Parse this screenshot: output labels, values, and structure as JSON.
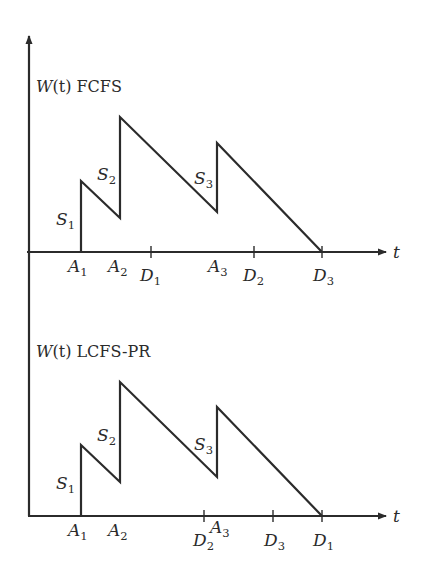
{
  "diagram": {
    "y_axis_x": 29,
    "axis_color": "#2b2b2b",
    "panels": [
      {
        "id": "fcfs",
        "title_fn": "W(t)",
        "title_fn_w": "W",
        "title_fn_arg": "(t)",
        "title_policy": "FCFS",
        "baseline_y": 252,
        "x_axis_label": "t",
        "arrivals": [
          {
            "name": "A",
            "sub": "1",
            "x": 81
          },
          {
            "name": "A",
            "sub": "2",
            "x": 120
          },
          {
            "name": "A",
            "sub": "3",
            "x": 217
          }
        ],
        "departures": [
          {
            "name": "D",
            "sub": "1",
            "x": 151
          },
          {
            "name": "D",
            "sub": "2",
            "x": 254
          },
          {
            "name": "D",
            "sub": "3",
            "x": 322
          }
        ],
        "service_labels": [
          {
            "name": "S",
            "sub": "1"
          },
          {
            "name": "S",
            "sub": "2"
          },
          {
            "name": "S",
            "sub": "3"
          }
        ],
        "workload_points": [
          [
            81,
            252
          ],
          [
            81,
            181
          ],
          [
            120,
            218
          ],
          [
            120,
            117
          ],
          [
            217,
            212
          ],
          [
            217,
            143
          ],
          [
            322,
            252
          ]
        ]
      },
      {
        "id": "lcfs-pr",
        "title_fn": "W(t)",
        "title_fn_w": "W",
        "title_fn_arg": "(t)",
        "title_policy": "LCFS-PR",
        "baseline_y": 516,
        "x_axis_label": "t",
        "arrivals": [
          {
            "name": "A",
            "sub": "1",
            "x": 81
          },
          {
            "name": "A",
            "sub": "2",
            "x": 120
          },
          {
            "name": "A",
            "sub": "3",
            "x": 217
          }
        ],
        "departures": [
          {
            "name": "D",
            "sub": "2",
            "x": 204
          },
          {
            "name": "D",
            "sub": "3",
            "x": 273
          },
          {
            "name": "D",
            "sub": "1",
            "x": 322
          }
        ],
        "service_labels": [
          {
            "name": "S",
            "sub": "1"
          },
          {
            "name": "S",
            "sub": "2"
          },
          {
            "name": "S",
            "sub": "3"
          }
        ],
        "workload_points": [
          [
            81,
            516
          ],
          [
            81,
            445
          ],
          [
            120,
            482
          ],
          [
            120,
            382
          ],
          [
            217,
            477
          ],
          [
            217,
            407
          ],
          [
            322,
            516
          ]
        ]
      }
    ]
  }
}
